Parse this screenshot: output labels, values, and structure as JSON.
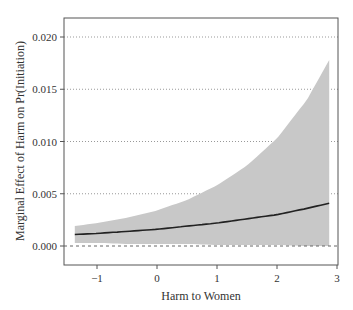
{
  "chart_data": {
    "type": "line",
    "title": "",
    "xlabel": "Harm to Women",
    "ylabel": "Marginal Effect of Harm on Pr(Initiation)",
    "xlim": [
      -1.55,
      3.02
    ],
    "ylim": [
      -0.0018,
      0.0218
    ],
    "xticks": [
      -1,
      0,
      1,
      2,
      3
    ],
    "xtick_labels": [
      "−1",
      "0",
      "1",
      "2",
      "3"
    ],
    "yticks": [
      0.0,
      0.005,
      0.01,
      0.015,
      0.02
    ],
    "ytick_labels": [
      "0.000",
      "0.005",
      "0.010",
      "0.015",
      "0.020"
    ],
    "grid": "horizontal dotted",
    "reference_line": {
      "y": 0,
      "style": "dashed"
    },
    "series": [
      {
        "name": "Marginal effect",
        "x": [
          -1.37,
          -1.0,
          -0.5,
          0.0,
          0.5,
          1.0,
          1.5,
          2.0,
          2.5,
          2.87
        ],
        "y": [
          0.0011,
          0.0012,
          0.0014,
          0.0016,
          0.0019,
          0.0022,
          0.0026,
          0.003,
          0.0036,
          0.0041
        ]
      },
      {
        "name": "95% CI upper",
        "x": [
          -1.37,
          -1.0,
          -0.5,
          0.0,
          0.5,
          1.0,
          1.5,
          2.0,
          2.5,
          2.87
        ],
        "y": [
          0.0019,
          0.0022,
          0.0027,
          0.0034,
          0.0044,
          0.0058,
          0.0077,
          0.0103,
          0.014,
          0.0178
        ]
      },
      {
        "name": "95% CI lower",
        "x": [
          -1.37,
          -1.0,
          -0.5,
          0.0,
          0.5,
          1.0,
          1.5,
          2.0,
          2.5,
          2.87
        ],
        "y": [
          0.0003,
          0.0003,
          0.0002,
          0.0002,
          0.0002,
          0.0001,
          0.0001,
          0.0001,
          0.0,
          0.0
        ]
      }
    ]
  }
}
